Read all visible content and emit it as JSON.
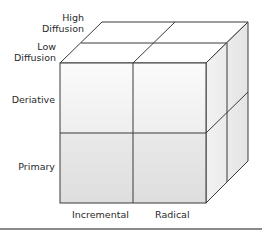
{
  "diagram": {
    "type": "3d-cube-matrix",
    "depth_axis": {
      "labels": [
        {
          "line1": "High",
          "line2": "Diffusion"
        },
        {
          "line1": "Low",
          "line2": "Diffusion"
        }
      ]
    },
    "vertical_axis": {
      "labels": [
        "Deriative",
        "Primary"
      ]
    },
    "horizontal_axis": {
      "labels": [
        "Incremental",
        "Radical"
      ]
    },
    "colors": {
      "stroke": "#3a3a3a",
      "front_top": "#f6f6f6",
      "front_bottom": "#e6e6e6",
      "top_face": "#ffffff",
      "side_face": "#f0f0f0",
      "rule": "#8a8a8a"
    }
  }
}
